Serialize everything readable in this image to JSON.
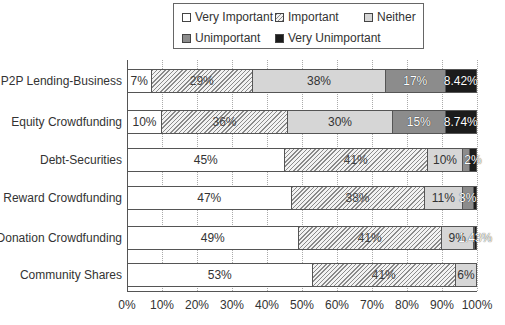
{
  "legend": {
    "items": [
      {
        "label": "Very Important",
        "key": "vi",
        "color": "#ffffff",
        "pattern": "none"
      },
      {
        "label": "Important",
        "key": "im",
        "color": "#f2f2f2",
        "pattern": "diagonal-hatch"
      },
      {
        "label": "Neither",
        "key": "ne",
        "color": "#d6d6d6",
        "pattern": "none"
      },
      {
        "label": "Unimportant",
        "key": "un",
        "color": "#8c8c8c",
        "pattern": "none"
      },
      {
        "label": "Very Unimportant",
        "key": "vu",
        "color": "#1c1c1c",
        "pattern": "none"
      }
    ]
  },
  "axis": {
    "ticks": [
      "0%",
      "10%",
      "20%",
      "30%",
      "40%",
      "50%",
      "60%",
      "70%",
      "80%",
      "90%",
      "100%"
    ]
  },
  "rows": [
    {
      "label": "P2P Lending-Business",
      "segments": [
        {
          "key": "vi",
          "value": 7,
          "text": "7%"
        },
        {
          "key": "im",
          "value": 29,
          "text": "29%"
        },
        {
          "key": "ne",
          "value": 38,
          "text": "38%"
        },
        {
          "key": "un",
          "value": 17,
          "text": "17%"
        },
        {
          "key": "vu",
          "value": 9,
          "text": "8.42%"
        }
      ]
    },
    {
      "label": "Equity Crowdfunding",
      "segments": [
        {
          "key": "vi",
          "value": 10,
          "text": "10%"
        },
        {
          "key": "im",
          "value": 36,
          "text": "36%"
        },
        {
          "key": "ne",
          "value": 30,
          "text": "30%"
        },
        {
          "key": "un",
          "value": 15,
          "text": "15%"
        },
        {
          "key": "vu",
          "value": 9,
          "text": "8.74%"
        }
      ]
    },
    {
      "label": "Debt-Securities",
      "segments": [
        {
          "key": "vi",
          "value": 45,
          "text": "45%"
        },
        {
          "key": "im",
          "value": 41,
          "text": "41%"
        },
        {
          "key": "ne",
          "value": 10,
          "text": "10%"
        },
        {
          "key": "un",
          "value": 2,
          "text": ""
        },
        {
          "key": "vu",
          "value": 2,
          "text": "2%"
        }
      ]
    },
    {
      "label": "Reward Crowdfunding",
      "segments": [
        {
          "key": "vi",
          "value": 47,
          "text": "47%"
        },
        {
          "key": "im",
          "value": 38,
          "text": "38%"
        },
        {
          "key": "ne",
          "value": 11,
          "text": "11%"
        },
        {
          "key": "un",
          "value": 3,
          "text": "3%"
        },
        {
          "key": "vu",
          "value": 1,
          "text": ""
        }
      ]
    },
    {
      "label": "Donation Crowdfunding",
      "segments": [
        {
          "key": "vi",
          "value": 49,
          "text": "49%"
        },
        {
          "key": "im",
          "value": 41,
          "text": "41%"
        },
        {
          "key": "ne",
          "value": 9,
          "text": "9%"
        },
        {
          "key": "un",
          "value": 0.3,
          "text": ""
        },
        {
          "key": "vu",
          "value": 0.7,
          "text": "1.43%"
        }
      ]
    },
    {
      "label": "Community Shares",
      "segments": [
        {
          "key": "vi",
          "value": 53,
          "text": "53%"
        },
        {
          "key": "im",
          "value": 41,
          "text": "41%"
        },
        {
          "key": "ne",
          "value": 6,
          "text": "6%"
        },
        {
          "key": "un",
          "value": 0,
          "text": ""
        },
        {
          "key": "vu",
          "value": 0,
          "text": ""
        }
      ]
    }
  ],
  "chart_data": {
    "type": "bar",
    "orientation": "horizontal",
    "stacked": "100%",
    "title": "",
    "xlabel": "",
    "ylabel": "",
    "xlim": [
      0,
      100
    ],
    "x_ticks": [
      "0%",
      "10%",
      "20%",
      "30%",
      "40%",
      "50%",
      "60%",
      "70%",
      "80%",
      "90%",
      "100%"
    ],
    "grid": "vertical dotted",
    "legend_position": "top",
    "categories": [
      "P2P Lending-Business",
      "Equity Crowdfunding",
      "Debt-Securities",
      "Reward Crowdfunding",
      "Donation Crowdfunding",
      "Community Shares"
    ],
    "series": [
      {
        "name": "Very Important",
        "values": [
          7,
          10,
          45,
          47,
          49,
          53
        ]
      },
      {
        "name": "Important",
        "values": [
          29,
          36,
          41,
          38,
          41,
          41
        ]
      },
      {
        "name": "Neither",
        "values": [
          38,
          30,
          10,
          11,
          9,
          6
        ]
      },
      {
        "name": "Unimportant",
        "values": [
          17,
          15,
          2,
          3,
          0.3,
          0
        ]
      },
      {
        "name": "Very Unimportant",
        "values": [
          9,
          9,
          2,
          1,
          0.7,
          0
        ]
      }
    ],
    "data_labels": {
      "P2P Lending-Business": [
        "7%",
        "29%",
        "38%",
        "17%",
        "8.42%"
      ],
      "Equity Crowdfunding": [
        "10%",
        "36%",
        "30%",
        "15%",
        "8.74%"
      ],
      "Debt-Securities": [
        "45%",
        "41%",
        "10%",
        "",
        "2%"
      ],
      "Reward Crowdfunding": [
        "47%",
        "38%",
        "11%",
        "3%",
        ""
      ],
      "Donation Crowdfunding": [
        "49%",
        "41%",
        "9%",
        "",
        "1.43%"
      ],
      "Community Shares": [
        "53%",
        "41%",
        "6%",
        "",
        ""
      ]
    }
  }
}
